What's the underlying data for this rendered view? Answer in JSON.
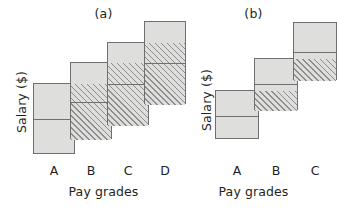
{
  "figure": {
    "colors": {
      "box_fill": "#dededc",
      "box_stroke": "#6f6f6f",
      "hatch_line": "#8d8d8d",
      "text": "#231f20",
      "background": "#ffffff"
    }
  },
  "chart_data": [
    {
      "type": "bar",
      "id": "panel-a",
      "title": "(a)",
      "xlabel": "Pay grades",
      "ylabel": "Salary ($)",
      "grid": false,
      "legend": false,
      "axis_ticks_shown": false,
      "note": "Overlapping pay-grade salary ranges; wide overlap between adjacent grades.",
      "categories": [
        "A",
        "B",
        "C",
        "D"
      ],
      "ylim": [
        0,
        100
      ],
      "boxes": [
        {
          "category": "A",
          "range_min": 4,
          "range_max": 48,
          "midpoint": 26,
          "overlap_min": null,
          "overlap_max": null,
          "hatched": false
        },
        {
          "category": "B",
          "range_min": 13,
          "range_max": 61,
          "midpoint": 37,
          "overlap_min": 13,
          "overlap_max": 48,
          "hatched": true
        },
        {
          "category": "C",
          "range_min": 22,
          "range_max": 74,
          "midpoint": 48,
          "overlap_min": 22,
          "overlap_max": 61,
          "hatched": true
        },
        {
          "category": "D",
          "range_min": 35,
          "range_max": 87,
          "midpoint": 61,
          "overlap_min": 35,
          "overlap_max": 74,
          "hatched": true
        }
      ]
    },
    {
      "type": "bar",
      "id": "panel-b",
      "title": "(b)",
      "xlabel": "Pay grades",
      "ylabel": "Salary ($)",
      "grid": false,
      "legend": false,
      "axis_ticks_shown": false,
      "note": "Fewer, wider pay grades with narrow overlap between adjacent grades.",
      "categories": [
        "A",
        "B",
        "C"
      ],
      "ylim": [
        0,
        100
      ],
      "boxes": [
        {
          "category": "A",
          "range_min": 13,
          "range_max": 44,
          "midpoint": 28,
          "overlap_min": null,
          "overlap_max": null,
          "hatched": false
        },
        {
          "category": "B",
          "range_min": 31,
          "range_max": 64,
          "midpoint": 48,
          "overlap_min": 31,
          "overlap_max": 44,
          "hatched": true
        },
        {
          "category": "C",
          "range_min": 50,
          "range_max": 86,
          "midpoint": 68,
          "overlap_min": 50,
          "overlap_max": 64,
          "hatched": true
        }
      ]
    }
  ]
}
